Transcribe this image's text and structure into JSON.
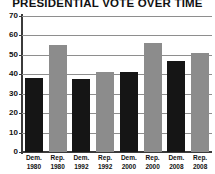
{
  "chart_data": {
    "type": "bar",
    "title": "PRESIDENTIAL VOTE OVER TIME",
    "xlabel": "",
    "ylabel": "",
    "ylim": [
      0,
      70
    ],
    "ytick_values": [
      70,
      60,
      50,
      40,
      30,
      20,
      10,
      0
    ],
    "ytick_labels": [
      "70",
      "60",
      "50",
      "40",
      "30",
      "20",
      "10",
      "0"
    ],
    "grid": true,
    "legend": "none",
    "categories": [
      "Dem. 1980",
      "Rep. 1980",
      "Dem. 1992",
      "Rep. 1992",
      "Dem. 2000",
      "Rep. 2000",
      "Dem. 2008",
      "Rep. 2008"
    ],
    "category_lines": [
      {
        "party": "Dem.",
        "year": "1980"
      },
      {
        "party": "Rep.",
        "year": "1980"
      },
      {
        "party": "Dem.",
        "year": "1992"
      },
      {
        "party": "Rep.",
        "year": "1992"
      },
      {
        "party": "Dem.",
        "year": "2000"
      },
      {
        "party": "Rep.",
        "year": "2000"
      },
      {
        "party": "Dem.",
        "year": "2008"
      },
      {
        "party": "Rep.",
        "year": "2008"
      }
    ],
    "values": [
      38,
      55,
      37.5,
      41,
      41,
      56,
      47,
      51
    ],
    "bar_colors": [
      "#151515",
      "#8c8c8c",
      "#151515",
      "#8c8c8c",
      "#151515",
      "#8c8c8c",
      "#151515",
      "#8c8c8c"
    ]
  },
  "style": {
    "dem_color": "#151515",
    "rep_color": "#8c8c8c",
    "grid_color": "#8e8e8e",
    "axis_color": "#3b3b3b",
    "text_color": "#111111",
    "background": "#ffffff"
  }
}
